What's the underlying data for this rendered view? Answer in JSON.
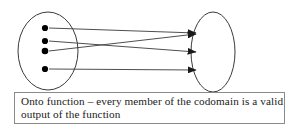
{
  "figure": {
    "title_semantic": "onto-function-mapping-diagram",
    "stroke_color": "#3a3a3a",
    "dot_color": "#000000",
    "arrow_color": "#1a1a1a",
    "background": "#ffffff",
    "domain_set": {
      "name": "domain-ellipse",
      "cx": 48,
      "cy": 51,
      "rx": 30,
      "ry": 39,
      "elements": [
        {
          "label": "",
          "cx": 45,
          "cy": 28
        },
        {
          "label": "",
          "cx": 45,
          "cy": 41
        },
        {
          "label": "",
          "cx": 45,
          "cy": 51
        },
        {
          "label": "",
          "cx": 45,
          "cy": 69
        }
      ]
    },
    "codomain_set": {
      "name": "codomain-ellipse",
      "cx": 213,
      "cy": 52,
      "rx": 22,
      "ry": 40,
      "targets": [
        {
          "label": "",
          "x": 201,
          "y": 34
        },
        {
          "label": "",
          "x": 201,
          "y": 53
        },
        {
          "label": "",
          "x": 201,
          "y": 70
        }
      ]
    },
    "mappings": [
      {
        "name": "mapping-1",
        "from_index": 0,
        "to_index": 0,
        "x1": 49,
        "y1": 28,
        "x2": 196,
        "y2": 33
      },
      {
        "name": "mapping-2",
        "from_index": 1,
        "to_index": 1,
        "x1": 49,
        "y1": 41,
        "x2": 196,
        "y2": 52
      },
      {
        "name": "mapping-3",
        "from_index": 2,
        "to_index": 0,
        "x1": 49,
        "y1": 51,
        "x2": 196,
        "y2": 34
      },
      {
        "name": "mapping-4",
        "from_index": 3,
        "to_index": 2,
        "x1": 49,
        "y1": 69,
        "x2": 196,
        "y2": 70
      }
    ]
  },
  "caption": {
    "line1": "Onto function – every member of the codomain is a valid",
    "line2": "output of the function",
    "border_color": "#8a8a8a"
  }
}
